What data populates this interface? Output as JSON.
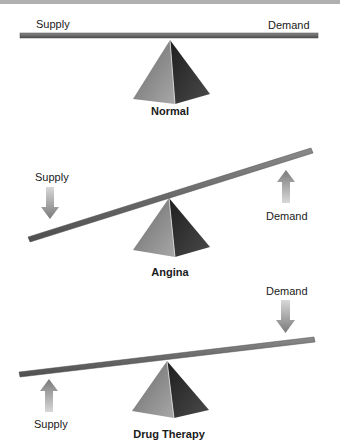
{
  "diagram": {
    "colors": {
      "beam": "#6e6e6e",
      "beam_edge": "#4a4a4a",
      "pyramid_light": "#9a9a9a",
      "pyramid_dark": "#2e2e2e",
      "arrow": "#8e8e8e",
      "top_border": "#9c9c9c"
    },
    "panels": [
      {
        "id": "normal",
        "caption": "Normal",
        "left_label": "Supply",
        "right_label": "Demand",
        "state": "balanced"
      },
      {
        "id": "angina",
        "caption": "Angina",
        "left_label": "Supply",
        "left_arrow": "down-arrow",
        "right_label": "Demand",
        "right_arrow": "up-arrow",
        "state": "demand exceeds supply"
      },
      {
        "id": "drug-therapy",
        "caption": "Drug Therapy",
        "left_label": "Supply",
        "left_arrow": "up-arrow",
        "right_label": "Demand",
        "right_arrow": "down-arrow",
        "state": "restored toward balance"
      }
    ]
  }
}
